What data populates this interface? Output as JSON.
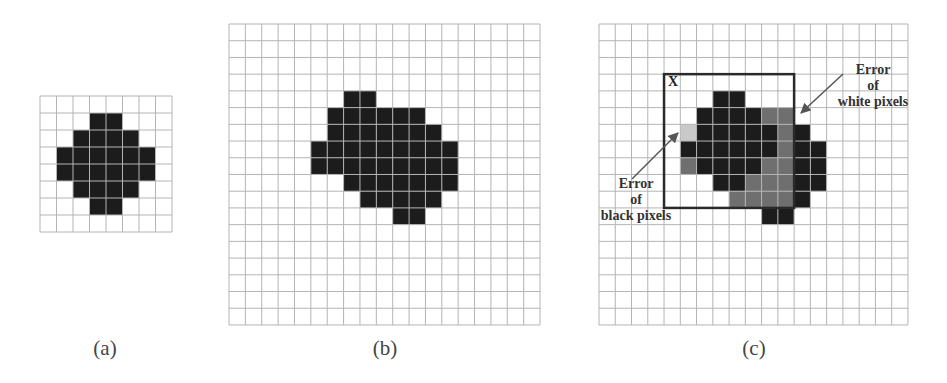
{
  "colors": {
    "grid_line": "#b4b4b4",
    "black_pixel": "#1c1c1c",
    "error_white_pixel": "#6f6f6f",
    "error_black_pixel": "#c9c9c9",
    "box": "#2a2a2a",
    "arrow": "#555555"
  },
  "panels": [
    {
      "id": "a",
      "caption": "(a)",
      "x": 40,
      "y": 96,
      "cols": 8,
      "rows": 8,
      "cw": 16.5,
      "ch": 17,
      "black": [
        [
          1,
          3
        ],
        [
          1,
          4
        ],
        [
          2,
          2
        ],
        [
          2,
          3
        ],
        [
          2,
          4
        ],
        [
          2,
          5
        ],
        [
          3,
          1
        ],
        [
          3,
          2
        ],
        [
          3,
          3
        ],
        [
          3,
          4
        ],
        [
          3,
          5
        ],
        [
          3,
          6
        ],
        [
          4,
          1
        ],
        [
          4,
          2
        ],
        [
          4,
          3
        ],
        [
          4,
          4
        ],
        [
          4,
          5
        ],
        [
          4,
          6
        ],
        [
          5,
          2
        ],
        [
          5,
          3
        ],
        [
          5,
          4
        ],
        [
          5,
          5
        ],
        [
          6,
          3
        ],
        [
          6,
          4
        ]
      ],
      "caption_x": 65,
      "caption_y": 338
    },
    {
      "id": "b",
      "caption": "(b)",
      "x": 229,
      "y": 24,
      "cols": 19,
      "rows": 18,
      "cw": 16.37,
      "ch": 16.72,
      "black": [
        [
          4,
          7
        ],
        [
          4,
          8
        ],
        [
          5,
          6
        ],
        [
          5,
          7
        ],
        [
          5,
          8
        ],
        [
          5,
          9
        ],
        [
          5,
          10
        ],
        [
          5,
          11
        ],
        [
          6,
          6
        ],
        [
          6,
          7
        ],
        [
          6,
          8
        ],
        [
          6,
          9
        ],
        [
          6,
          10
        ],
        [
          6,
          11
        ],
        [
          6,
          12
        ],
        [
          7,
          5
        ],
        [
          7,
          6
        ],
        [
          7,
          7
        ],
        [
          7,
          8
        ],
        [
          7,
          9
        ],
        [
          7,
          10
        ],
        [
          7,
          11
        ],
        [
          7,
          12
        ],
        [
          7,
          13
        ],
        [
          8,
          5
        ],
        [
          8,
          6
        ],
        [
          8,
          7
        ],
        [
          8,
          8
        ],
        [
          8,
          9
        ],
        [
          8,
          10
        ],
        [
          8,
          11
        ],
        [
          8,
          12
        ],
        [
          8,
          13
        ],
        [
          9,
          7
        ],
        [
          9,
          8
        ],
        [
          9,
          9
        ],
        [
          9,
          10
        ],
        [
          9,
          11
        ],
        [
          9,
          12
        ],
        [
          9,
          13
        ],
        [
          10,
          8
        ],
        [
          10,
          9
        ],
        [
          10,
          10
        ],
        [
          10,
          11
        ],
        [
          10,
          12
        ],
        [
          11,
          10
        ],
        [
          11,
          11
        ]
      ],
      "caption_x": 345,
      "caption_y": 338
    },
    {
      "id": "c",
      "caption": "(c)",
      "x": 599,
      "y": 24,
      "cols": 19,
      "rows": 18,
      "cw": 16.26,
      "ch": 16.72,
      "black": [
        [
          4,
          7
        ],
        [
          4,
          8
        ],
        [
          5,
          6
        ],
        [
          5,
          7
        ],
        [
          5,
          8
        ],
        [
          5,
          9
        ],
        [
          6,
          6
        ],
        [
          6,
          7
        ],
        [
          6,
          8
        ],
        [
          6,
          9
        ],
        [
          6,
          10
        ],
        [
          6,
          12
        ],
        [
          7,
          5
        ],
        [
          7,
          6
        ],
        [
          7,
          7
        ],
        [
          7,
          8
        ],
        [
          7,
          9
        ],
        [
          7,
          10
        ],
        [
          7,
          12
        ],
        [
          7,
          13
        ],
        [
          8,
          6
        ],
        [
          8,
          7
        ],
        [
          8,
          8
        ],
        [
          8,
          9
        ],
        [
          8,
          12
        ],
        [
          8,
          13
        ],
        [
          9,
          7
        ],
        [
          9,
          8
        ],
        [
          9,
          12
        ],
        [
          9,
          13
        ],
        [
          10,
          12
        ],
        [
          11,
          10
        ],
        [
          11,
          11
        ]
      ],
      "error_white": [
        [
          5,
          10
        ],
        [
          5,
          11
        ],
        [
          6,
          11
        ],
        [
          7,
          11
        ],
        [
          8,
          5
        ],
        [
          8,
          10
        ],
        [
          8,
          11
        ],
        [
          9,
          9
        ],
        [
          9,
          10
        ],
        [
          9,
          11
        ],
        [
          10,
          8
        ],
        [
          10,
          9
        ],
        [
          10,
          10
        ],
        [
          10,
          11
        ]
      ],
      "error_black": [
        [
          6,
          5
        ]
      ],
      "box": {
        "col": 4,
        "row": 3,
        "cols": 8,
        "rows": 8,
        "label": "X"
      },
      "annotations": {
        "white_error": {
          "lines": [
            "Error",
            "of",
            "white pixels"
          ]
        },
        "black_error": {
          "lines": [
            "Error",
            "of",
            "black pixels"
          ]
        }
      },
      "caption_x": 714,
      "caption_y": 338
    }
  ]
}
